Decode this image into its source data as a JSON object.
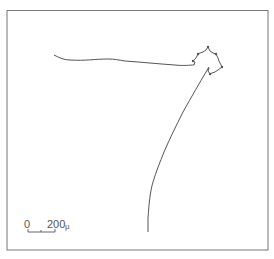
{
  "figure": {
    "type": "trajectory-trace",
    "frame": {
      "x": 7,
      "y": 10,
      "width": 261,
      "height": 240,
      "color": "#777777"
    },
    "track_color": "#555555",
    "track": {
      "segments": [
        {
          "name": "horizontal-approach",
          "description": "wavy path running left to right near top"
        },
        {
          "name": "star-loop",
          "description": "small star-shaped looping pattern with nodes at upper right"
        },
        {
          "name": "descending-path",
          "description": "long path descending diagonally down-left to bottom"
        }
      ]
    },
    "scale_bar": {
      "start_label": "0",
      "end_label": "200",
      "unit": "μ"
    }
  }
}
